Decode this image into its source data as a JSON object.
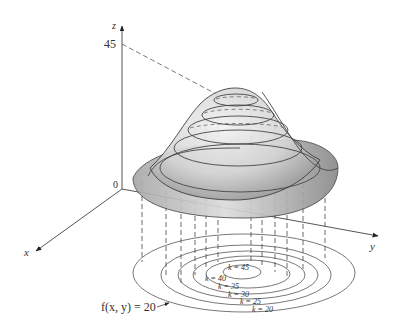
{
  "figure": {
    "type": "3d surface with level curves",
    "axes": {
      "x_label": "x",
      "y_label": "y",
      "z_label": "z",
      "origin_label": "0",
      "z_tick_label": "45"
    },
    "surface_label": "f(x, y)",
    "level_curve_callout": "f(x, y) = 20",
    "contours": [
      {
        "k": 20,
        "label": "k = 20"
      },
      {
        "k": 25,
        "label": "k = 25"
      },
      {
        "k": 30,
        "label": "k = 30"
      },
      {
        "k": 35,
        "label": "k = 35"
      },
      {
        "k": 40,
        "label": "k = 40"
      },
      {
        "k": 45,
        "label": "k = 45"
      }
    ],
    "colors": {
      "line": "#333333",
      "surface_light": "#e6e6e6",
      "surface_dark": "#9a9a9a",
      "dashed": "#444444"
    }
  }
}
